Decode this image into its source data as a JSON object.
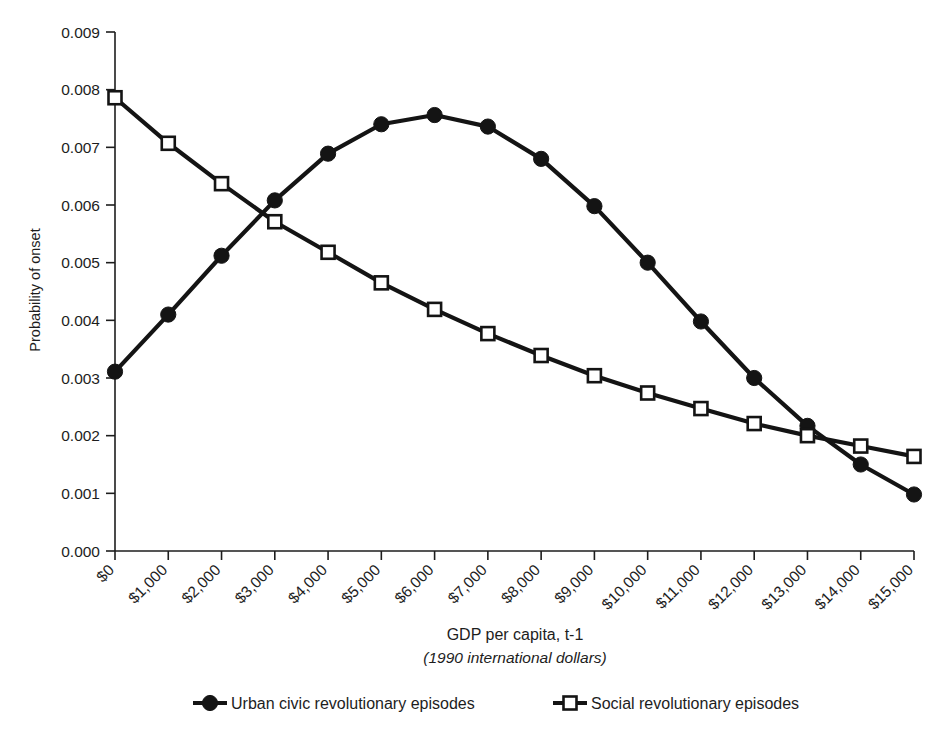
{
  "chart_data": {
    "type": "line",
    "title": "",
    "subtitle": "",
    "xlabel": "GDP per capita, t-1",
    "xlabel_sub": "(1990 international dollars)",
    "ylabel": "Probability of onset",
    "xlim": [
      0,
      15000
    ],
    "ylim": [
      0.0,
      0.009
    ],
    "grid": false,
    "legend_position": "bottom",
    "x": [
      0,
      1000,
      2000,
      3000,
      4000,
      5000,
      6000,
      7000,
      8000,
      9000,
      10000,
      11000,
      12000,
      13000,
      14000,
      15000
    ],
    "categories": [
      "$0",
      "$1,000",
      "$2,000",
      "$3,000",
      "$4,000",
      "$5,000",
      "$6,000",
      "$7,000",
      "$8,000",
      "$9,000",
      "$10,000",
      "$11,000",
      "$12,000",
      "$13,000",
      "$14,000",
      "$15,000"
    ],
    "xtick_labels": [
      "$0",
      "$1,000",
      "$2,000",
      "$3,000",
      "$4,000",
      "$5,000",
      "$6,000",
      "$7,000",
      "$8,000",
      "$9,000",
      "$10,000",
      "$11,000",
      "$12,000",
      "$13,000",
      "$14,000",
      "$15,000"
    ],
    "ytick_labels": [
      "0.009",
      "0.008",
      "0.007",
      "0.006",
      "0.005",
      "0.004",
      "0.003",
      "0.002",
      "0.001",
      "0.000"
    ],
    "ytick_values": [
      0.009,
      0.008,
      0.007,
      0.006,
      0.005,
      0.004,
      0.003,
      0.002,
      0.001,
      0.0
    ],
    "series": [
      {
        "name": "Urban civic revolutionary episodes",
        "marker": "filled-circle",
        "color": "#141414",
        "values": [
          0.00311,
          0.0041,
          0.00512,
          0.00608,
          0.00689,
          0.0074,
          0.00756,
          0.00736,
          0.0068,
          0.00598,
          0.005,
          0.00398,
          0.003,
          0.00217,
          0.0015,
          0.00098
        ]
      },
      {
        "name": "Social revolutionary episodes",
        "marker": "open-square",
        "color": "#141414",
        "values": [
          0.00786,
          0.00707,
          0.00637,
          0.00571,
          0.00518,
          0.00465,
          0.00419,
          0.00377,
          0.00339,
          0.00304,
          0.00274,
          0.00247,
          0.00221,
          0.002,
          0.00182,
          0.00164
        ]
      }
    ]
  },
  "legend": {
    "items": [
      {
        "label": "Urban civic revolutionary episodes",
        "marker": "filled-circle"
      },
      {
        "label": "Social revolutionary episodes",
        "marker": "open-square"
      }
    ]
  }
}
